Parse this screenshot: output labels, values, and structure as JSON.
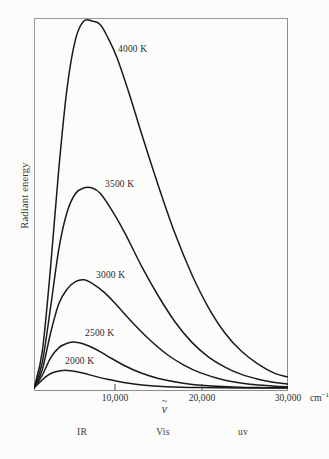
{
  "figure": {
    "background_color": "#fbfbfa",
    "frame_color": "#8d8d8d",
    "curve_color": "#1a1a1a"
  },
  "axes": {
    "y_title": "Radiant energy",
    "x_symbol_base": "ν",
    "x_symbol_tilde": "~",
    "x_unit_text": "cm",
    "x_unit_exponent": "−1"
  },
  "x_ticks": [
    {
      "label": "10,000",
      "value": 10000,
      "px": 115
    },
    {
      "label": "20,000",
      "value": 20000,
      "px": 202
    },
    {
      "label": "30,000",
      "value": 30000,
      "px": 288
    }
  ],
  "regions": [
    {
      "label": "IR",
      "px": 82
    },
    {
      "label": "Vis",
      "px": 163
    },
    {
      "label": "uv",
      "px": 243
    }
  ],
  "curve_labels": [
    {
      "text": "4000 K",
      "left": 118,
      "top": 44
    },
    {
      "text": "3500 K",
      "left": 105,
      "top": 179
    },
    {
      "text": "3000 K",
      "left": 96,
      "top": 270
    },
    {
      "text": "2500 K",
      "left": 85,
      "top": 328
    },
    {
      "text": "2000 K",
      "left": 65,
      "top": 356
    }
  ],
  "chart_data": {
    "type": "line",
    "title": "",
    "xlabel": "ν̃ (cm⁻¹)",
    "ylabel": "Radiant energy",
    "xlim": [
      0,
      30600
    ],
    "ylim": [
      0,
      1.0
    ],
    "grid": false,
    "legend": "inline-curve-labels",
    "x_tick_labels": [
      "10,000",
      "20,000",
      "30,000"
    ],
    "x_tick_values": [
      10000,
      20000,
      30000
    ],
    "y_tick_labels": [],
    "annotations": [
      {
        "text": "IR",
        "x": 5600,
        "note": "infrared region marker below axis"
      },
      {
        "text": "Vis",
        "x": 15100,
        "note": "visible region marker below axis"
      },
      {
        "text": "uv",
        "x": 24500,
        "note": "ultraviolet region marker below axis"
      }
    ],
    "series": [
      {
        "name": "4000 K",
        "temperature_K": 4000,
        "peak": {
          "x": 8000,
          "y": 1.0
        },
        "x": [
          0,
          1000,
          2000,
          3000,
          4000,
          5000,
          6000,
          7000,
          8000,
          9000,
          10000,
          11500,
          13000,
          15000,
          17000,
          19000,
          21000,
          23000,
          25000,
          27000,
          29000,
          30600
        ],
        "y": [
          0.0,
          0.1,
          0.33,
          0.6,
          0.82,
          0.95,
          1.0,
          1.0,
          0.99,
          0.95,
          0.9,
          0.8,
          0.69,
          0.55,
          0.42,
          0.31,
          0.22,
          0.15,
          0.1,
          0.065,
          0.04,
          0.03
        ]
      },
      {
        "name": "3500 K",
        "temperature_K": 3500,
        "peak": {
          "x": 6800,
          "y": 0.545
        },
        "x": [
          0,
          1000,
          2000,
          3000,
          4000,
          5000,
          6000,
          7000,
          8000,
          9500,
          11000,
          13000,
          15000,
          17000,
          19000,
          21000,
          23000,
          25000,
          27000,
          29000,
          30600
        ],
        "y": [
          0.0,
          0.07,
          0.22,
          0.38,
          0.48,
          0.53,
          0.545,
          0.545,
          0.53,
          0.48,
          0.42,
          0.33,
          0.25,
          0.18,
          0.125,
          0.085,
          0.057,
          0.037,
          0.024,
          0.015,
          0.011
        ]
      },
      {
        "name": "3000 K",
        "temperature_K": 3000,
        "peak": {
          "x": 5700,
          "y": 0.295
        },
        "x": [
          0,
          1000,
          2000,
          3000,
          4000,
          5000,
          6000,
          7000,
          8500,
          10000,
          12000,
          14000,
          16000,
          18000,
          20000,
          23000,
          26000,
          29000,
          30600
        ],
        "y": [
          0.0,
          0.05,
          0.15,
          0.23,
          0.27,
          0.29,
          0.295,
          0.285,
          0.26,
          0.225,
          0.175,
          0.13,
          0.092,
          0.063,
          0.042,
          0.021,
          0.01,
          0.005,
          0.003
        ]
      },
      {
        "name": "2500 K",
        "temperature_K": 2500,
        "peak": {
          "x": 4600,
          "y": 0.125
        },
        "x": [
          0,
          1000,
          2000,
          3000,
          4000,
          5000,
          6000,
          7500,
          9000,
          11000,
          13000,
          15000,
          18000,
          21000,
          24000,
          27000,
          30600
        ],
        "y": [
          0.0,
          0.035,
          0.082,
          0.11,
          0.122,
          0.125,
          0.12,
          0.105,
          0.085,
          0.06,
          0.04,
          0.026,
          0.013,
          0.006,
          0.003,
          0.0012,
          0.0005
        ]
      },
      {
        "name": "2000 K",
        "temperature_K": 2000,
        "peak": {
          "x": 3800,
          "y": 0.048
        },
        "x": [
          0,
          800,
          1600,
          2400,
          3200,
          4000,
          5000,
          6000,
          7500,
          9000,
          11000,
          13000,
          16000,
          20000,
          25000,
          30600
        ],
        "y": [
          0.0,
          0.018,
          0.034,
          0.043,
          0.047,
          0.048,
          0.045,
          0.04,
          0.031,
          0.023,
          0.014,
          0.008,
          0.0035,
          0.0012,
          0.0003,
          0.0001
        ]
      }
    ]
  }
}
